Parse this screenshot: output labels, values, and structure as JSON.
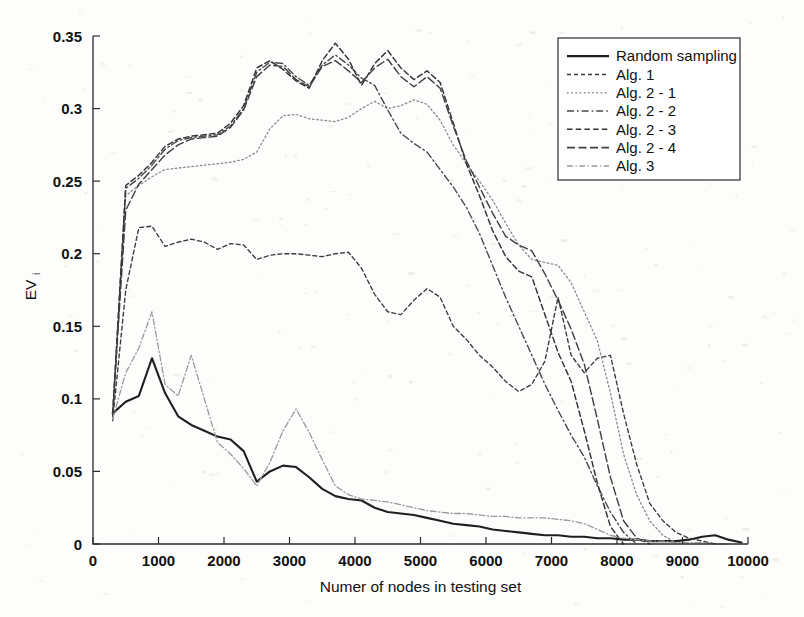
{
  "figure": {
    "width": 804,
    "height": 617,
    "background": "#fdfdfc",
    "ink_color": "#2b2b2b"
  },
  "chart_data": {
    "type": "line",
    "title": "",
    "xlabel": "Numer of nodes in testing set",
    "ylabel": "EV",
    "ylabel_subscript": "i",
    "xlim": [
      0,
      10000
    ],
    "ylim": [
      0,
      0.35
    ],
    "xticks": [
      0,
      1000,
      2000,
      3000,
      4000,
      5000,
      6000,
      7000,
      8000,
      9000,
      10000
    ],
    "xtick_labels": [
      "0",
      "1000",
      "2000",
      "3000",
      "4000",
      "5000",
      "6000",
      "7000",
      "8000",
      "9000",
      "10000"
    ],
    "yticks": [
      0,
      0.05,
      0.1,
      0.15,
      0.2,
      0.25,
      0.3,
      0.35
    ],
    "ytick_labels": [
      "0",
      "0.05",
      "0.1",
      "0.15",
      "0.2",
      "0.25",
      "0.3",
      "0.35"
    ],
    "grid": false,
    "legend_position": "top-right",
    "series": [
      {
        "name": "Random sampling",
        "style": "solid",
        "dash": "none",
        "color": "#1f1f1f",
        "width": 2.1,
        "x": [
          300,
          500,
          700,
          900,
          1100,
          1300,
          1500,
          1700,
          1900,
          2100,
          2300,
          2500,
          2700,
          2900,
          3100,
          3300,
          3500,
          3700,
          3900,
          4100,
          4300,
          4500,
          4700,
          4900,
          5100,
          5300,
          5500,
          5700,
          5900,
          6100,
          6300,
          6500,
          6700,
          6900,
          7100,
          7300,
          7500,
          7700,
          7900,
          8100,
          8300,
          8500,
          8700,
          8900,
          9100,
          9300,
          9500,
          9700,
          9900
        ],
        "y": [
          0.09,
          0.098,
          0.102,
          0.128,
          0.104,
          0.088,
          0.082,
          0.078,
          0.074,
          0.072,
          0.064,
          0.043,
          0.05,
          0.054,
          0.053,
          0.046,
          0.038,
          0.033,
          0.031,
          0.03,
          0.025,
          0.022,
          0.021,
          0.02,
          0.018,
          0.016,
          0.014,
          0.013,
          0.012,
          0.01,
          0.009,
          0.008,
          0.007,
          0.006,
          0.006,
          0.005,
          0.005,
          0.004,
          0.004,
          0.003,
          0.003,
          0.002,
          0.002,
          0.002,
          0.003,
          0.005,
          0.006,
          0.003,
          0.001
        ]
      },
      {
        "name": "Alg. 1",
        "style": "dashed-fine",
        "dash": "4,3",
        "color": "#3a3a3a",
        "width": 1.35,
        "x": [
          300,
          500,
          700,
          900,
          1100,
          1300,
          1500,
          1700,
          1900,
          2100,
          2300,
          2500,
          2700,
          2900,
          3100,
          3300,
          3500,
          3700,
          3900,
          4100,
          4300,
          4500,
          4700,
          4900,
          5100,
          5300,
          5500,
          5700,
          5900,
          6100,
          6300,
          6500,
          6700,
          6900,
          7100,
          7300,
          7500,
          7700,
          7900,
          8100,
          8300,
          8500,
          8700,
          8900,
          9100,
          9300,
          9500
        ],
        "y": [
          0.085,
          0.175,
          0.218,
          0.219,
          0.205,
          0.208,
          0.21,
          0.208,
          0.203,
          0.207,
          0.206,
          0.196,
          0.199,
          0.2,
          0.2,
          0.199,
          0.198,
          0.2,
          0.201,
          0.19,
          0.172,
          0.16,
          0.158,
          0.168,
          0.176,
          0.17,
          0.15,
          0.141,
          0.13,
          0.122,
          0.112,
          0.105,
          0.11,
          0.126,
          0.17,
          0.13,
          0.118,
          0.128,
          0.13,
          0.09,
          0.055,
          0.028,
          0.016,
          0.008,
          0.004,
          0.002,
          0.0
        ]
      },
      {
        "name": "Alg. 2 - 1",
        "style": "dotted-light",
        "dash": "1.6,2.6",
        "color": "#8a8a8a",
        "width": 1.3,
        "x": [
          300,
          500,
          700,
          900,
          1100,
          1300,
          1500,
          1700,
          1900,
          2100,
          2300,
          2500,
          2700,
          2900,
          3100,
          3300,
          3500,
          3700,
          3900,
          4100,
          4300,
          4500,
          4700,
          4900,
          5100,
          5300,
          5500,
          5700,
          5900,
          6100,
          6300,
          6500,
          6700,
          6900,
          7100,
          7300,
          7500,
          7700,
          7900,
          8100,
          8300,
          8500,
          8700,
          8900
        ],
        "y": [
          0.086,
          0.24,
          0.247,
          0.253,
          0.258,
          0.259,
          0.26,
          0.261,
          0.262,
          0.263,
          0.265,
          0.27,
          0.286,
          0.295,
          0.296,
          0.293,
          0.292,
          0.291,
          0.294,
          0.3,
          0.305,
          0.3,
          0.302,
          0.306,
          0.303,
          0.292,
          0.275,
          0.262,
          0.25,
          0.237,
          0.221,
          0.206,
          0.196,
          0.194,
          0.192,
          0.18,
          0.16,
          0.14,
          0.104,
          0.062,
          0.034,
          0.016,
          0.006,
          0.001
        ]
      },
      {
        "name": "Alg. 2 - 2",
        "style": "dashdot",
        "dash": "7,3,1.6,3",
        "color": "#4a4a4a",
        "width": 1.4,
        "x": [
          300,
          500,
          700,
          900,
          1100,
          1300,
          1500,
          1700,
          1900,
          2100,
          2300,
          2500,
          2700,
          2900,
          3100,
          3300,
          3500,
          3700,
          3900,
          4100,
          4300,
          4500,
          4700,
          4900,
          5100,
          5300,
          5500,
          5700,
          5900,
          6100,
          6300,
          6500,
          6700,
          6900,
          7100,
          7300,
          7500,
          7700,
          7900,
          8100,
          8300
        ],
        "y": [
          0.088,
          0.245,
          0.252,
          0.261,
          0.272,
          0.278,
          0.28,
          0.281,
          0.282,
          0.288,
          0.3,
          0.325,
          0.332,
          0.331,
          0.322,
          0.316,
          0.33,
          0.337,
          0.33,
          0.321,
          0.316,
          0.299,
          0.283,
          0.276,
          0.27,
          0.258,
          0.246,
          0.232,
          0.214,
          0.192,
          0.17,
          0.15,
          0.13,
          0.11,
          0.092,
          0.075,
          0.06,
          0.04,
          0.022,
          0.008,
          0.0
        ]
      },
      {
        "name": "Alg. 2 - 3",
        "style": "dashed-mid",
        "dash": "5.5,3.2",
        "color": "#333333",
        "width": 1.45,
        "x": [
          300,
          500,
          700,
          900,
          1100,
          1300,
          1500,
          1700,
          1900,
          2100,
          2300,
          2500,
          2700,
          2900,
          3100,
          3300,
          3500,
          3700,
          3900,
          4100,
          4300,
          4500,
          4700,
          4900,
          5100,
          5300,
          5500,
          5700,
          5900,
          6100,
          6300,
          6500,
          6700,
          6900,
          7100,
          7300,
          7500,
          7700,
          7900,
          8100
        ],
        "y": [
          0.09,
          0.247,
          0.254,
          0.263,
          0.274,
          0.279,
          0.281,
          0.282,
          0.283,
          0.29,
          0.302,
          0.328,
          0.333,
          0.327,
          0.319,
          0.314,
          0.333,
          0.345,
          0.334,
          0.316,
          0.331,
          0.34,
          0.328,
          0.32,
          0.326,
          0.318,
          0.29,
          0.262,
          0.24,
          0.216,
          0.198,
          0.188,
          0.184,
          0.158,
          0.132,
          0.112,
          0.078,
          0.042,
          0.012,
          0.0
        ]
      },
      {
        "name": "Alg. 2 - 4",
        "style": "dashed-long",
        "dash": "8,3.5",
        "color": "#3f3f3f",
        "width": 1.4,
        "x": [
          300,
          500,
          700,
          900,
          1100,
          1300,
          1500,
          1700,
          1900,
          2100,
          2300,
          2500,
          2700,
          2900,
          3100,
          3300,
          3500,
          3700,
          3900,
          4100,
          4300,
          4500,
          4700,
          4900,
          5100,
          5300,
          5500,
          5700,
          5900,
          6100,
          6300,
          6500,
          6700,
          6900,
          7100,
          7300,
          7500,
          7700,
          7900,
          8100,
          8300,
          8500
        ],
        "y": [
          0.089,
          0.23,
          0.248,
          0.258,
          0.268,
          0.275,
          0.279,
          0.28,
          0.281,
          0.287,
          0.299,
          0.322,
          0.33,
          0.329,
          0.32,
          0.315,
          0.329,
          0.333,
          0.326,
          0.318,
          0.328,
          0.334,
          0.322,
          0.315,
          0.322,
          0.314,
          0.288,
          0.264,
          0.246,
          0.228,
          0.212,
          0.206,
          0.202,
          0.186,
          0.168,
          0.148,
          0.124,
          0.086,
          0.046,
          0.016,
          0.004,
          0.0
        ]
      },
      {
        "name": "Alg. 3",
        "style": "dashdot-light",
        "dash": "6,2.5,1.2,2.5",
        "color": "#9a9a9a",
        "width": 1.3,
        "x": [
          300,
          500,
          700,
          900,
          1100,
          1300,
          1500,
          1700,
          1900,
          2100,
          2300,
          2500,
          2700,
          2900,
          3100,
          3300,
          3500,
          3700,
          3900,
          4100,
          4300,
          4500,
          4700,
          4900,
          5100,
          5300,
          5500,
          5700,
          5900,
          6100,
          6300,
          6500,
          6700,
          6900,
          7100,
          7300,
          7500,
          7700,
          7900,
          8100,
          8300,
          8500,
          8700,
          8900,
          9100,
          9300,
          9500,
          9700
        ],
        "y": [
          0.086,
          0.118,
          0.135,
          0.16,
          0.11,
          0.102,
          0.13,
          0.1,
          0.07,
          0.062,
          0.052,
          0.04,
          0.056,
          0.078,
          0.093,
          0.077,
          0.058,
          0.04,
          0.034,
          0.031,
          0.03,
          0.029,
          0.027,
          0.025,
          0.023,
          0.022,
          0.021,
          0.021,
          0.02,
          0.019,
          0.019,
          0.018,
          0.018,
          0.018,
          0.017,
          0.016,
          0.014,
          0.01,
          0.006,
          0.004,
          0.003,
          0.002,
          0.002,
          0.001,
          0.001,
          0.001,
          0.0,
          0.0
        ]
      }
    ]
  },
  "legend": {
    "items": [
      {
        "label": "Random sampling"
      },
      {
        "label": "Alg. 1"
      },
      {
        "label": "Alg. 2 - 1"
      },
      {
        "label": "Alg. 2 - 2"
      },
      {
        "label": "Alg. 2 - 3"
      },
      {
        "label": "Alg. 2 - 4"
      },
      {
        "label": "Alg. 3"
      }
    ]
  }
}
